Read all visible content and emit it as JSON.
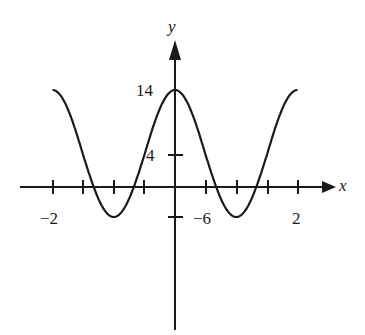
{
  "chart_data": {
    "type": "line",
    "title": "",
    "xlabel": "x",
    "ylabel": "y",
    "function": "y = 10cos(pi x) + 4",
    "x_tick_labels": [
      "-2",
      "2"
    ],
    "y_tick_labels": [
      "14",
      "4",
      "-6"
    ],
    "x_ticks": [
      -2,
      -1.5,
      -1,
      -0.5,
      0,
      0.5,
      1,
      1.5,
      2
    ],
    "y_ticks": [
      14,
      4,
      -6
    ],
    "xlim": [
      -2,
      2
    ],
    "ylim": [
      -6,
      14
    ],
    "x": [
      -2,
      -1.5,
      -1,
      -0.5,
      0,
      0.5,
      1,
      1.5,
      2
    ],
    "series": [
      {
        "name": "curve",
        "values": [
          14,
          4,
          -6,
          4,
          14,
          4,
          -6,
          4,
          14
        ]
      }
    ],
    "grid": false,
    "legend": "none"
  },
  "labels": {
    "x_axis": "x",
    "y_axis": "y",
    "y_max": "14",
    "y_mid": "4",
    "y_min": "−6",
    "x_min": "−2",
    "x_max": "2"
  }
}
